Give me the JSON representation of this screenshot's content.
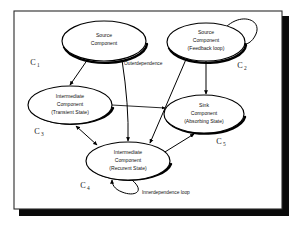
{
  "figure": {
    "background": "#ffffff",
    "frame_color": "#2b2b2b",
    "shadow_color": "#0a0a0a",
    "stroke_color": "#000000"
  },
  "nodes": [
    {
      "id": "c1",
      "lines": [
        "Source",
        "Component"
      ],
      "line1": "Source",
      "line2": "Component",
      "line3": "",
      "tag": "C",
      "subscript": "1",
      "cx": 104,
      "cy": 41,
      "rx": 42,
      "ry": 20
    },
    {
      "id": "c2",
      "lines": [
        "Source",
        "Component",
        "(Feedback loop)"
      ],
      "line1": "Source",
      "line2": "Component",
      "line3": "(Feedback loop)",
      "tag": "C",
      "subscript": "2",
      "cx": 206,
      "cy": 42,
      "rx": 39,
      "ry": 19
    },
    {
      "id": "c3",
      "lines": [
        "Intermediate",
        "Component",
        "(Transient State)"
      ],
      "line1": "Intermediate",
      "line2": "Component",
      "line3": "(Transient State)",
      "tag": "C",
      "subscript": "3",
      "cx": 70,
      "cy": 105,
      "rx": 42,
      "ry": 19
    },
    {
      "id": "c4",
      "lines": [
        "Intermediate",
        "Component",
        "(Recurent State)"
      ],
      "line1": "Intermediate",
      "line2": "Component",
      "line3": "(Recurent State)",
      "tag": "C",
      "subscript": "4",
      "cx": 128,
      "cy": 161,
      "rx": 42,
      "ry": 19
    },
    {
      "id": "c5",
      "lines": [
        "Sink",
        "Component",
        "(Absorbing State)"
      ],
      "line1": "Sink",
      "line2": "Component",
      "line3": "(Absorbing State)",
      "tag": "C",
      "subscript": "5",
      "cx": 204,
      "cy": 114,
      "rx": 40,
      "ry": 19
    }
  ],
  "annotations": [
    {
      "id": "outer",
      "text": "Outerdependence",
      "x": 124,
      "y": 65
    },
    {
      "id": "inner",
      "text": "Innerdependence  loop",
      "x": 142,
      "y": 194
    }
  ],
  "edges": [
    {
      "id": "c1-to-c3",
      "from": "c1",
      "to": "c3",
      "kind": "directed"
    },
    {
      "id": "c1-to-c4",
      "from": "c1",
      "to": "c4",
      "kind": "directed"
    },
    {
      "id": "c2-to-c5",
      "from": "c2",
      "to": "c5",
      "kind": "directed"
    },
    {
      "id": "c2-to-c4",
      "from": "c2",
      "to": "c4",
      "kind": "directed"
    },
    {
      "id": "c2-self",
      "from": "c2",
      "to": "c2",
      "kind": "self-loop"
    },
    {
      "id": "c3-to-c5",
      "from": "c3",
      "to": "c5",
      "kind": "directed"
    },
    {
      "id": "c3-c4",
      "from": "c3",
      "to": "c4",
      "kind": "bidirectional"
    },
    {
      "id": "c4-to-c5",
      "from": "c4",
      "to": "c5",
      "kind": "directed"
    },
    {
      "id": "c4-self",
      "from": "c4",
      "to": "c4",
      "kind": "self-loop"
    }
  ]
}
